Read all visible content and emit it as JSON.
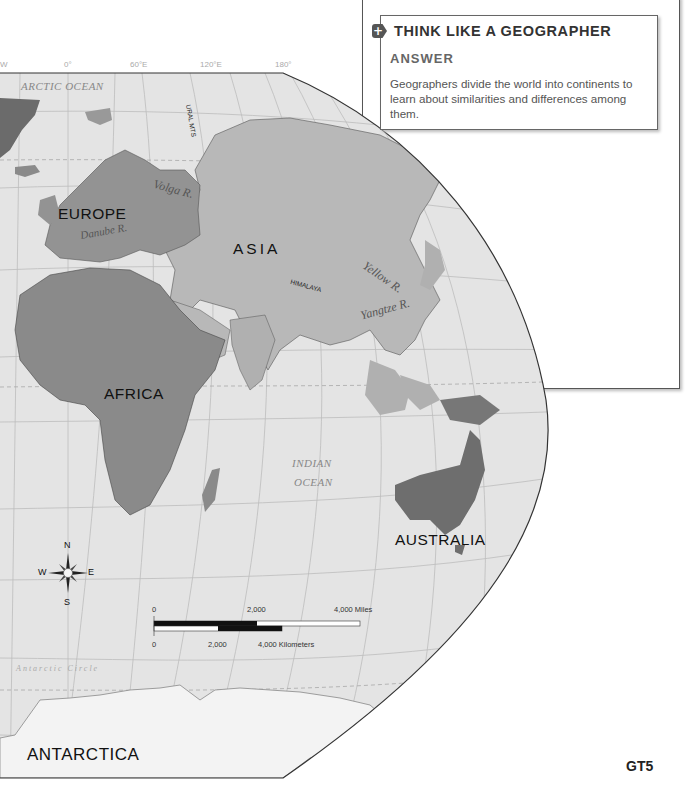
{
  "page": {
    "cut_top_text": "…division of the world into regions — eight…",
    "page_number": "GT5"
  },
  "sidebar_box": {
    "icon": "plus-icon",
    "title": "THINK LIKE A GEOGRAPHER",
    "subtitle": "ANSWER",
    "body": "Geographers divide the world into continents to learn about similarities and differences among them."
  },
  "map": {
    "longitude_labels": [
      "W",
      "0°",
      "60°E",
      "120°E",
      "180°"
    ],
    "continents": {
      "europe": "EUROPE",
      "asia": "ASIA",
      "africa": "AFRICA",
      "australia": "AUSTRALIA",
      "antarctica": "ANTARCTICA"
    },
    "oceans": {
      "arctic": "ARCTIC OCEAN",
      "indian_1": "INDIAN",
      "indian_2": "OCEAN"
    },
    "features": {
      "ural": "URAL MTS",
      "himalaya": "HIMALAYA",
      "volga": "Volga R.",
      "danube": "Danube R.",
      "yellow": "Yellow R.",
      "yangtze": "Yangtze R.",
      "nile": "Nile R.",
      "congo": "Congo R.",
      "antarctic_circle": "Antarctic Circle"
    },
    "compass": {
      "n": "N",
      "s": "S",
      "e": "E",
      "w": "W"
    },
    "scale": {
      "miles": [
        "0",
        "2,000",
        "4,000 Miles"
      ],
      "km": [
        "0",
        "2,000",
        "4,000 Kilometers"
      ]
    },
    "colors": {
      "ocean": "#e6e6e6",
      "asia_land": "#b4b4b4",
      "dark_land": "#8a8a8a",
      "europe_land": "#959595",
      "antarctica": "#f2f2f2",
      "grid": "#bdbdbd"
    }
  }
}
